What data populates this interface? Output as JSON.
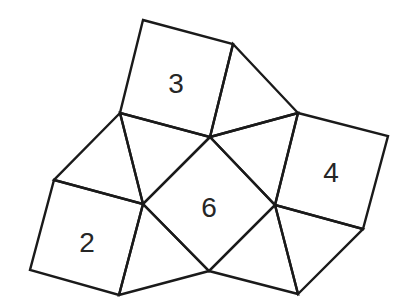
{
  "diagram": {
    "stroke_color": "#1a1a1a",
    "label_color": "#262626",
    "background": "#ffffff",
    "vertices": {
      "A": [
        143,
        20
      ],
      "B": [
        233,
        44
      ],
      "C": [
        298,
        113
      ],
      "D": [
        388,
        136
      ],
      "E": [
        363,
        229
      ],
      "F": [
        298,
        294
      ],
      "G": [
        209,
        271
      ],
      "H": [
        119,
        295
      ],
      "I": [
        30,
        270
      ],
      "J": [
        54,
        180
      ],
      "K": [
        120,
        113
      ],
      "L": [
        210,
        137
      ],
      "M": [
        275,
        205
      ],
      "N": [
        143,
        204
      ]
    },
    "squares": [
      {
        "id": "square-3",
        "label": "3",
        "points": "143,20 233,44 210,137 120,113",
        "label_pos": [
          176,
          83
        ]
      },
      {
        "id": "square-4",
        "label": "4",
        "points": "298,113 388,136 363,229 275,205",
        "label_pos": [
          331,
          172
        ]
      },
      {
        "id": "square-6",
        "label": "6",
        "points": "210,137 275,205 209,271 143,204",
        "label_pos": [
          209,
          207
        ]
      },
      {
        "id": "square-2",
        "label": "2",
        "points": "54,180 143,204 119,295 30,270",
        "label_pos": [
          87,
          242
        ]
      }
    ],
    "triangles": [
      {
        "id": "triangle-top-right",
        "points": "233,44 298,113 210,137"
      },
      {
        "id": "triangle-upper-mid-right",
        "points": "210,137 298,113 275,205"
      },
      {
        "id": "triangle-upper-mid-left",
        "points": "120,113 210,137 143,204"
      },
      {
        "id": "triangle-left",
        "points": "120,113 143,204 54,180"
      },
      {
        "id": "triangle-bottom-left",
        "points": "143,204 209,271 119,295"
      },
      {
        "id": "triangle-bottom-mid-right",
        "points": "275,205 298,294 209,271"
      },
      {
        "id": "triangle-bottom-right",
        "points": "275,205 363,229 298,294"
      }
    ]
  }
}
